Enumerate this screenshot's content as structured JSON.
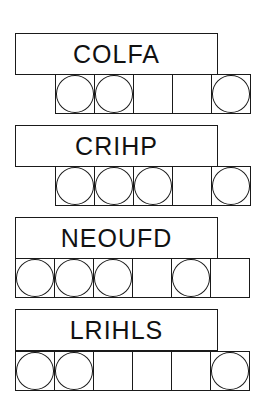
{
  "puzzles": [
    {
      "word": "COLFA",
      "cells": [
        true,
        true,
        false,
        false,
        true
      ],
      "title": {
        "left": 15,
        "top": 33,
        "width": 203
      },
      "cells_pos": {
        "left": 55,
        "top": 74
      }
    },
    {
      "word": "CRIHP",
      "cells": [
        true,
        true,
        true,
        false,
        true
      ],
      "title": {
        "left": 15,
        "top": 125,
        "width": 203
      },
      "cells_pos": {
        "left": 55,
        "top": 166
      }
    },
    {
      "word": "NEOUFD",
      "cells": [
        true,
        true,
        true,
        false,
        true,
        false
      ],
      "title": {
        "left": 15,
        "top": 217,
        "width": 203
      },
      "cells_pos": {
        "left": 15,
        "top": 258
      }
    },
    {
      "word": "LRIHLS",
      "cells": [
        true,
        true,
        false,
        false,
        false,
        true
      ],
      "title": {
        "left": 15,
        "top": 309,
        "width": 203
      },
      "cells_pos": {
        "left": 15,
        "top": 351
      }
    }
  ]
}
